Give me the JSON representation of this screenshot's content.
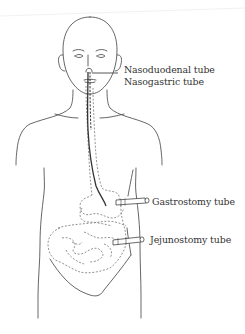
{
  "figure": {
    "labels": [
      {
        "id": "nasoduodenal",
        "text": "Nasoduodenal tube"
      },
      {
        "id": "nasogastric",
        "text": "Nasogastric tube"
      },
      {
        "id": "gastrostomy",
        "text": "Gastrostomy tube"
      },
      {
        "id": "jejunostomy",
        "text": "Jejunostomy tube"
      }
    ],
    "colors": {
      "background": "#ffffff",
      "outline": "#555555",
      "text": "#333333"
    }
  }
}
